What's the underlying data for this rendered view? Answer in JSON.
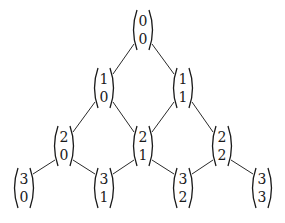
{
  "diagram": {
    "title": "",
    "nodes": [
      {
        "id": "n00",
        "n": "0",
        "k": "0",
        "x": 143,
        "y": 30
      },
      {
        "id": "n10",
        "n": "1",
        "k": "0",
        "x": 104,
        "y": 88
      },
      {
        "id": "n11",
        "n": "1",
        "k": "1",
        "x": 183,
        "y": 88
      },
      {
        "id": "n20",
        "n": "2",
        "k": "0",
        "x": 64,
        "y": 146
      },
      {
        "id": "n21",
        "n": "2",
        "k": "1",
        "x": 143,
        "y": 146
      },
      {
        "id": "n22",
        "n": "2",
        "k": "2",
        "x": 222,
        "y": 146
      },
      {
        "id": "n30",
        "n": "3",
        "k": "0",
        "x": 24,
        "y": 188
      },
      {
        "id": "n31",
        "n": "3",
        "k": "1",
        "x": 104,
        "y": 188
      },
      {
        "id": "n32",
        "n": "3",
        "k": "2",
        "x": 183,
        "y": 188
      },
      {
        "id": "n33",
        "n": "3",
        "k": "3",
        "x": 262,
        "y": 188
      }
    ],
    "edges": [
      [
        "n00",
        "n10"
      ],
      [
        "n00",
        "n11"
      ],
      [
        "n10",
        "n20"
      ],
      [
        "n10",
        "n21"
      ],
      [
        "n11",
        "n21"
      ],
      [
        "n11",
        "n22"
      ],
      [
        "n20",
        "n30"
      ],
      [
        "n20",
        "n31"
      ],
      [
        "n21",
        "n31"
      ],
      [
        "n21",
        "n32"
      ],
      [
        "n22",
        "n32"
      ],
      [
        "n22",
        "n33"
      ]
    ]
  }
}
